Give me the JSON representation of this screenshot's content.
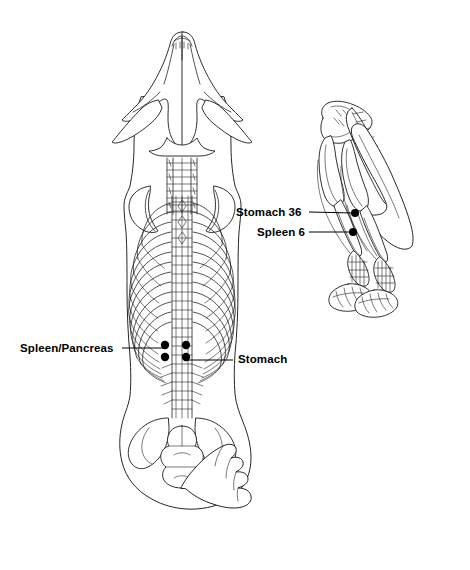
{
  "figure": {
    "type": "veterinary-acupuncture-point-diagram",
    "background_color": "#ffffff",
    "line_color": "#1a1a1a",
    "point_color": "#000000",
    "views": [
      {
        "name": "dorsal-skeleton-view",
        "description": "Dorsal (top-down) view of canine skeleton: skull, scapulae, cervical vertebrae, thoracic spine, rib cage, lumbar spine, pelvis and tail"
      },
      {
        "name": "hind-limb-view",
        "description": "Caudal-lateral view of canine hind limbs: pelvis, sacrum and tail vertebrae, femurs, tibiae, hocks and hind paws"
      }
    ]
  },
  "labels": [
    {
      "id": "spleen-pancreas",
      "text": "Spleen/Pancreas",
      "view": "dorsal-skeleton-view",
      "point_count": 2,
      "points": [
        {
          "x": 165,
          "y": 345
        },
        {
          "x": 165,
          "y": 357
        }
      ],
      "leader": {
        "x1": 122,
        "y1": 348,
        "x2": 166,
        "y2": 348
      }
    },
    {
      "id": "stomach",
      "text": "Stomach",
      "view": "dorsal-skeleton-view",
      "point_count": 2,
      "points": [
        {
          "x": 186,
          "y": 345
        },
        {
          "x": 186,
          "y": 357
        }
      ],
      "leader": {
        "x1": 186,
        "y1": 360,
        "x2": 233,
        "y2": 360
      }
    },
    {
      "id": "stomach-36",
      "text": "Stomach 36",
      "view": "hind-limb-view",
      "point_count": 1,
      "points": [
        {
          "x": 355,
          "y": 213
        }
      ],
      "leader": {
        "x1": 309,
        "y1": 212,
        "x2": 354,
        "y2": 213
      }
    },
    {
      "id": "spleen-6",
      "text": "Spleen 6",
      "view": "hind-limb-view",
      "point_count": 1,
      "points": [
        {
          "x": 353,
          "y": 232
        }
      ],
      "leader": {
        "x1": 309,
        "y1": 232,
        "x2": 352,
        "y2": 232
      }
    }
  ]
}
